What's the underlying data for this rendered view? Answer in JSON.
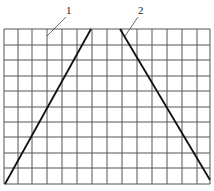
{
  "diagram": {
    "type": "grid-with-diagonals",
    "grid": {
      "columns": 14,
      "rows": 10,
      "x_lines": [
        4,
        18,
        32,
        47,
        62,
        77,
        92,
        107,
        122,
        137,
        152,
        167,
        182,
        197,
        210
      ],
      "y_lines": [
        29,
        45,
        60,
        76,
        91,
        107,
        122,
        137,
        153,
        168,
        184
      ],
      "line_color": "#555555"
    },
    "lines": [
      {
        "id": "1",
        "label": "1",
        "x1": 5,
        "y1": 184,
        "x2": 91,
        "y2": 29
      },
      {
        "id": "2",
        "label": "2",
        "x1": 120,
        "y1": 29,
        "x2": 210,
        "y2": 180
      }
    ],
    "labels": [
      {
        "text": "1",
        "x": 66,
        "y": 14,
        "leader": [
          66,
          17,
          47,
          36
        ]
      },
      {
        "text": "2",
        "x": 138,
        "y": 14,
        "leader": [
          138,
          17,
          125,
          36
        ]
      }
    ],
    "line_color": "#111111"
  }
}
